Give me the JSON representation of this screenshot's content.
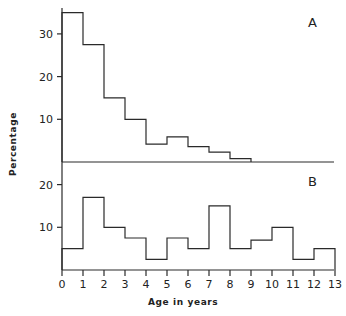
{
  "chart_data": [
    {
      "type": "bar",
      "panel": "A",
      "style": "step-histogram",
      "categories": [
        "0-1",
        "1-2",
        "2-3",
        "3-4",
        "4-5",
        "5-6",
        "6-7",
        "7-8",
        "8-9"
      ],
      "bin_edges": [
        0,
        1,
        2,
        3,
        4,
        5,
        6,
        7,
        8,
        9
      ],
      "values": [
        35,
        27.5,
        15,
        10,
        4.2,
        5.9,
        3.6,
        2.3,
        0.8
      ],
      "ylabel": "Percentage",
      "xlabel": "",
      "yticks": [
        10,
        20,
        30
      ],
      "ylim": [
        0,
        36
      ],
      "xlim": [
        0,
        13
      ],
      "grid": false,
      "annotation": "A"
    },
    {
      "type": "bar",
      "panel": "B",
      "style": "step-histogram",
      "categories": [
        "0-1",
        "1-2",
        "2-3",
        "3-4",
        "4-5",
        "5-6",
        "6-7",
        "7-8",
        "8-9",
        "9-10",
        "10-11",
        "11-12",
        "12-13"
      ],
      "bin_edges": [
        0,
        1,
        2,
        3,
        4,
        5,
        6,
        7,
        8,
        9,
        10,
        11,
        12,
        13
      ],
      "values": [
        5,
        17,
        10,
        7.5,
        2.5,
        7.5,
        5,
        15,
        5,
        7,
        10,
        2.5,
        5
      ],
      "ylabel": "Percentage",
      "xlabel": "Age in years",
      "yticks": [
        10,
        20
      ],
      "xticks": [
        0,
        1,
        2,
        3,
        4,
        5,
        6,
        7,
        8,
        9,
        10,
        11,
        12,
        13
      ],
      "ylim": [
        0,
        22
      ],
      "xlim": [
        0,
        13
      ],
      "grid": false,
      "annotation": "B"
    }
  ],
  "labels": {
    "ylabel": "Percentage",
    "xlabel": "Age in years",
    "panel_a": "A",
    "panel_b": "B",
    "xticks": [
      "0",
      "1",
      "2",
      "3",
      "4",
      "5",
      "6",
      "7",
      "8",
      "9",
      "10",
      "11",
      "12",
      "13"
    ],
    "a_yticks": [
      "10",
      "20",
      "30"
    ],
    "b_yticks": [
      "10",
      "20"
    ]
  }
}
